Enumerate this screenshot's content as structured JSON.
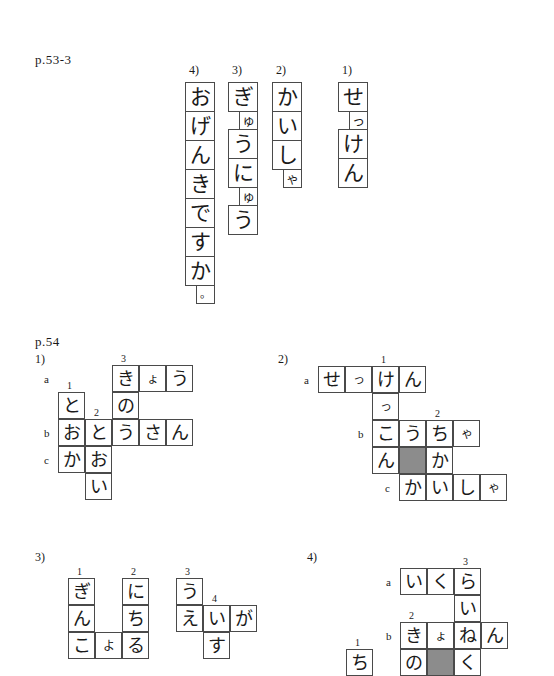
{
  "page": {
    "section_one_label": "p.53-3",
    "section_two_label": "p.54"
  },
  "vertical_words": [
    {
      "number": "4)",
      "reading": "おげんきですか。",
      "cells": [
        {
          "ch": "お",
          "size": "big"
        },
        {
          "ch": "げ",
          "size": "big"
        },
        {
          "ch": "ん",
          "size": "big"
        },
        {
          "ch": "き",
          "size": "big"
        },
        {
          "ch": "で",
          "size": "big"
        },
        {
          "ch": "す",
          "size": "big"
        },
        {
          "ch": "か",
          "size": "big"
        },
        {
          "ch": "。",
          "size": "dot"
        }
      ]
    },
    {
      "number": "3)",
      "reading": "ぎゅうにゅう",
      "cells": [
        {
          "ch": "ぎ",
          "size": "big"
        },
        {
          "ch": "ゅ",
          "size": "small"
        },
        {
          "ch": "う",
          "size": "big"
        },
        {
          "ch": "に",
          "size": "big"
        },
        {
          "ch": "ゅ",
          "size": "small"
        },
        {
          "ch": "う",
          "size": "big"
        }
      ]
    },
    {
      "number": "2)",
      "reading": "かいしゃ",
      "cells": [
        {
          "ch": "か",
          "size": "big"
        },
        {
          "ch": "い",
          "size": "big"
        },
        {
          "ch": "し",
          "size": "big"
        },
        {
          "ch": "ゃ",
          "size": "small"
        }
      ]
    },
    {
      "number": "1)",
      "reading": "せっけん",
      "cells": [
        {
          "ch": "せ",
          "size": "big"
        },
        {
          "ch": "っ",
          "size": "small"
        },
        {
          "ch": "け",
          "size": "big"
        },
        {
          "ch": "ん",
          "size": "big"
        }
      ]
    }
  ],
  "puzzles": [
    {
      "number": "1)",
      "row_labels": [
        {
          "text": "a",
          "col": -1,
          "row": 0
        },
        {
          "text": "b",
          "col": -1,
          "row": 2
        },
        {
          "text": "c",
          "col": -1,
          "row": 3
        }
      ],
      "clue_numbers": [
        {
          "text": "1",
          "col": 0,
          "row": 1
        },
        {
          "text": "2",
          "col": 1,
          "row": 2
        },
        {
          "text": "3",
          "col": 2,
          "row": 0
        }
      ],
      "cells": [
        {
          "col": 2,
          "row": 0,
          "ch": "き",
          "small": false
        },
        {
          "col": 3,
          "row": 0,
          "ch": "ょ",
          "small": true
        },
        {
          "col": 4,
          "row": 0,
          "ch": "う",
          "small": false
        },
        {
          "col": 0,
          "row": 1,
          "ch": "と",
          "small": false
        },
        {
          "col": 2,
          "row": 1,
          "ch": "の",
          "small": false
        },
        {
          "col": 0,
          "row": 2,
          "ch": "お",
          "small": false
        },
        {
          "col": 1,
          "row": 2,
          "ch": "と",
          "small": false
        },
        {
          "col": 2,
          "row": 2,
          "ch": "う",
          "small": false
        },
        {
          "col": 3,
          "row": 2,
          "ch": "さ",
          "small": false
        },
        {
          "col": 4,
          "row": 2,
          "ch": "ん",
          "small": false
        },
        {
          "col": 0,
          "row": 3,
          "ch": "か",
          "small": false
        },
        {
          "col": 1,
          "row": 3,
          "ch": "お",
          "small": false
        },
        {
          "col": 1,
          "row": 4,
          "ch": "い",
          "small": false
        }
      ]
    },
    {
      "number": "2)",
      "row_labels": [
        {
          "text": "a",
          "col": -1,
          "row": 0
        },
        {
          "text": "b",
          "col": 1,
          "row": 2
        },
        {
          "text": "c",
          "col": 2,
          "row": 4
        }
      ],
      "clue_numbers": [
        {
          "text": "1",
          "col": 2,
          "row": 0
        },
        {
          "text": "2",
          "col": 4,
          "row": 2
        }
      ],
      "cells": [
        {
          "col": 0,
          "row": 0,
          "ch": "せ",
          "small": false
        },
        {
          "col": 1,
          "row": 0,
          "ch": "っ",
          "small": true
        },
        {
          "col": 2,
          "row": 0,
          "ch": "け",
          "small": false
        },
        {
          "col": 3,
          "row": 0,
          "ch": "ん",
          "small": false
        },
        {
          "col": 2,
          "row": 1,
          "ch": "っ",
          "small": true
        },
        {
          "col": 2,
          "row": 2,
          "ch": "こ",
          "small": false
        },
        {
          "col": 3,
          "row": 2,
          "ch": "う",
          "small": false
        },
        {
          "col": 4,
          "row": 2,
          "ch": "ち",
          "small": false
        },
        {
          "col": 5,
          "row": 2,
          "ch": "ゃ",
          "small": true
        },
        {
          "col": 2,
          "row": 3,
          "ch": "ん",
          "small": false
        },
        {
          "col": 3,
          "row": 3,
          "ch": "",
          "small": false,
          "shade": true
        },
        {
          "col": 4,
          "row": 3,
          "ch": "か",
          "small": false
        },
        {
          "col": 3,
          "row": 4,
          "ch": "か",
          "small": false
        },
        {
          "col": 4,
          "row": 4,
          "ch": "い",
          "small": false
        },
        {
          "col": 5,
          "row": 4,
          "ch": "し",
          "small": false
        },
        {
          "col": 6,
          "row": 4,
          "ch": "ゃ",
          "small": true
        }
      ]
    },
    {
      "number": "3)",
      "row_labels": [
        {
          "text": "a",
          "col": 2,
          "row": 1
        },
        {
          "text": "b",
          "col": 0,
          "row": 2
        }
      ],
      "clue_numbers": [
        {
          "text": "1",
          "col": 0,
          "row": 0
        },
        {
          "text": "2",
          "col": 2,
          "row": 0
        },
        {
          "text": "3",
          "col": 4,
          "row": 0
        },
        {
          "text": "4",
          "col": 5,
          "row": 1
        }
      ],
      "cells": [
        {
          "col": 0,
          "row": 0,
          "ch": "ぎ",
          "small": false
        },
        {
          "col": 2,
          "row": 0,
          "ch": "に",
          "small": false
        },
        {
          "col": 4,
          "row": 0,
          "ch": "う",
          "small": false
        },
        {
          "col": 0,
          "row": 1,
          "ch": "ん",
          "small": false
        },
        {
          "col": 2,
          "row": 1,
          "ch": "ち",
          "small": false
        },
        {
          "col": 4,
          "row": 1,
          "ch": "え",
          "small": false
        },
        {
          "col": 5,
          "row": 1,
          "ch": "い",
          "small": false
        },
        {
          "col": 6,
          "row": 1,
          "ch": "が",
          "small": false
        },
        {
          "col": 0,
          "row": 2,
          "ch": "こ",
          "small": false
        },
        {
          "col": 1,
          "row": 2,
          "ch": "よ",
          "small": true
        },
        {
          "col": 2,
          "row": 2,
          "ch": "る",
          "small": false
        },
        {
          "col": 5,
          "row": 2,
          "ch": "す",
          "small": false
        }
      ]
    },
    {
      "number": "4)",
      "row_labels": [
        {
          "text": "a",
          "col": 1,
          "row": 0
        },
        {
          "text": "b",
          "col": 1,
          "row": 2
        }
      ],
      "clue_numbers": [
        {
          "text": "1",
          "col": 0,
          "row": 3
        },
        {
          "text": "2",
          "col": 2,
          "row": 2
        },
        {
          "text": "3",
          "col": 4,
          "row": 0
        }
      ],
      "cells": [
        {
          "col": 2,
          "row": 0,
          "ch": "い",
          "small": false
        },
        {
          "col": 3,
          "row": 0,
          "ch": "く",
          "small": false
        },
        {
          "col": 4,
          "row": 0,
          "ch": "ら",
          "small": false
        },
        {
          "col": 4,
          "row": 1,
          "ch": "い",
          "small": false
        },
        {
          "col": 2,
          "row": 2,
          "ch": "き",
          "small": false
        },
        {
          "col": 3,
          "row": 2,
          "ch": "ょ",
          "small": true
        },
        {
          "col": 4,
          "row": 2,
          "ch": "ね",
          "small": false
        },
        {
          "col": 5,
          "row": 2,
          "ch": "ん",
          "small": false
        },
        {
          "col": 0,
          "row": 3,
          "ch": "ち",
          "small": false
        },
        {
          "col": 2,
          "row": 3,
          "ch": "の",
          "small": false
        },
        {
          "col": 3,
          "row": 3,
          "ch": "",
          "small": false,
          "shade": true
        },
        {
          "col": 4,
          "row": 3,
          "ch": "く",
          "small": false
        }
      ]
    }
  ]
}
